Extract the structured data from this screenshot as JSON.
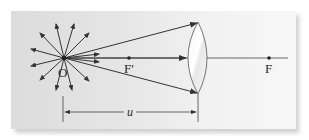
{
  "diagram": {
    "labels": {
      "object_point": "O",
      "near_focal_point": "F′",
      "far_focal_point": "F",
      "object_distance": "u"
    },
    "colors": {
      "rays": "#333333",
      "panel": "#e6e6e6",
      "lens_outline": "#555555"
    }
  }
}
